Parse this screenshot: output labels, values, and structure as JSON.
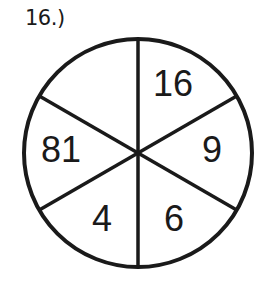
{
  "problem": {
    "label": "16.)"
  },
  "wheel": {
    "segments": [
      {
        "position": "top-right",
        "value": "16"
      },
      {
        "position": "right",
        "value": "9"
      },
      {
        "position": "bottom-right",
        "value": "6"
      },
      {
        "position": "bottom-left",
        "value": "4"
      },
      {
        "position": "left",
        "value": "81"
      },
      {
        "position": "top-left",
        "value": ""
      }
    ],
    "line_color": "#1a1a1a"
  }
}
